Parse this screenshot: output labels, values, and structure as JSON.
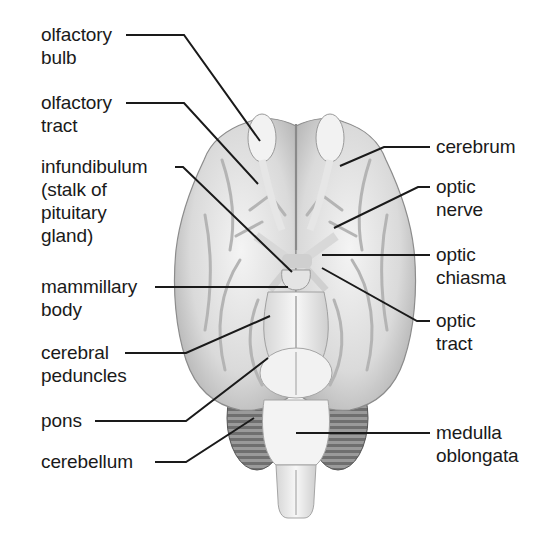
{
  "diagram": {
    "colors": {
      "background": "#ffffff",
      "tissue_light": "#f0f0f0",
      "tissue_mid": "#cfcfcf",
      "tissue_dark": "#9a9a9a",
      "cerebellum": "#8a8a8a",
      "leader_line": "#1a1a1a",
      "text": "#1a1a1a"
    },
    "labels_left": [
      {
        "id": "olfactory-bulb",
        "lines": [
          "olfactory",
          "bulb"
        ]
      },
      {
        "id": "olfactory-tract",
        "lines": [
          "olfactory",
          "tract"
        ]
      },
      {
        "id": "infundibulum",
        "lines": [
          "infundibulum",
          "(stalk of",
          "pituitary",
          "gland)"
        ]
      },
      {
        "id": "mammillary-body",
        "lines": [
          "mammillary",
          "body"
        ]
      },
      {
        "id": "cerebral-peduncles",
        "lines": [
          "cerebral",
          "peduncles"
        ]
      },
      {
        "id": "pons",
        "lines": [
          "pons"
        ]
      },
      {
        "id": "cerebellum",
        "lines": [
          "cerebellum"
        ]
      }
    ],
    "labels_right": [
      {
        "id": "cerebrum",
        "lines": [
          "cerebrum"
        ]
      },
      {
        "id": "optic-nerve",
        "lines": [
          "optic",
          "nerve"
        ]
      },
      {
        "id": "optic-chiasma",
        "lines": [
          "optic",
          "chiasma"
        ]
      },
      {
        "id": "optic-tract",
        "lines": [
          "optic",
          "tract"
        ]
      },
      {
        "id": "medulla-oblongata",
        "lines": [
          "medulla",
          "oblongata"
        ]
      }
    ]
  }
}
